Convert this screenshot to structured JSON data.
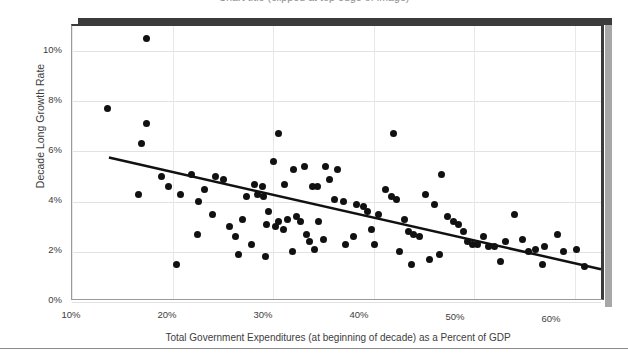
{
  "figure": {
    "title": "Chart title (clipped at top edge of image)",
    "background_color": "#ffffff",
    "frame_color": "#3b3b3b",
    "shadow_color": "#a7a7a7"
  },
  "chart_data": {
    "type": "scatter",
    "title": "",
    "xlabel": "Total Government Expenditures (at beginning of decade) as a Percent of GDP",
    "ylabel": "Decade Long Growth Rate",
    "xlim": [
      10,
      63
    ],
    "ylim": [
      0,
      11
    ],
    "grid": true,
    "legend": null,
    "marker_color": "#111111",
    "marker_size_px": 7,
    "xticks": [
      10,
      20,
      30,
      40,
      50,
      60
    ],
    "xticklabels": [
      "10%",
      "20%",
      "30%",
      "40%",
      "50%",
      "60%"
    ],
    "yticks": [
      0,
      2,
      4,
      6,
      8,
      10
    ],
    "yticklabels": [
      "0%",
      "2%",
      "4%",
      "6%",
      "8%",
      "10%"
    ],
    "series": [
      {
        "name": "Countries by decade",
        "points": [
          [
            17.4,
            10.5
          ],
          [
            13.5,
            7.7
          ],
          [
            17.4,
            7.1
          ],
          [
            16.9,
            6.3
          ],
          [
            30.5,
            6.7
          ],
          [
            42.0,
            6.7
          ],
          [
            16.6,
            4.3
          ],
          [
            21.9,
            5.1
          ],
          [
            24.3,
            5.0
          ],
          [
            25.1,
            4.9
          ],
          [
            22.6,
            4.0
          ],
          [
            30.0,
            5.6
          ],
          [
            33.1,
            5.4
          ],
          [
            36.4,
            5.3
          ],
          [
            28.1,
            4.7
          ],
          [
            28.9,
            4.6
          ],
          [
            27.4,
            4.2
          ],
          [
            28.4,
            4.3
          ],
          [
            29.0,
            4.2
          ],
          [
            31.1,
            4.7
          ],
          [
            32.0,
            5.3
          ],
          [
            33.9,
            4.6
          ],
          [
            34.4,
            4.6
          ],
          [
            35.2,
            5.4
          ],
          [
            35.6,
            4.9
          ],
          [
            27.0,
            3.3
          ],
          [
            29.5,
            3.6
          ],
          [
            29.3,
            3.1
          ],
          [
            30.2,
            3.0
          ],
          [
            30.5,
            3.2
          ],
          [
            31.4,
            3.3
          ],
          [
            31.0,
            2.9
          ],
          [
            32.3,
            3.4
          ],
          [
            32.7,
            3.2
          ],
          [
            33.3,
            2.7
          ],
          [
            34.5,
            3.2
          ],
          [
            36.1,
            4.1
          ],
          [
            37.0,
            4.0
          ],
          [
            38.3,
            3.9
          ],
          [
            39.0,
            3.8
          ],
          [
            39.4,
            3.6
          ],
          [
            40.5,
            3.5
          ],
          [
            41.2,
            4.5
          ],
          [
            41.8,
            4.2
          ],
          [
            42.3,
            4.1
          ],
          [
            43.1,
            3.3
          ],
          [
            43.5,
            2.8
          ],
          [
            44.0,
            2.7
          ],
          [
            44.6,
            2.6
          ],
          [
            45.2,
            4.3
          ],
          [
            46.0,
            3.9
          ],
          [
            46.7,
            5.1
          ],
          [
            47.3,
            3.4
          ],
          [
            47.9,
            3.2
          ],
          [
            48.4,
            3.1
          ],
          [
            48.9,
            2.8
          ],
          [
            49.3,
            2.4
          ],
          [
            49.8,
            2.3
          ],
          [
            50.3,
            2.3
          ],
          [
            50.9,
            2.6
          ],
          [
            51.4,
            2.2
          ],
          [
            52.0,
            2.2
          ],
          [
            53.1,
            2.4
          ],
          [
            54.0,
            3.5
          ],
          [
            54.8,
            2.5
          ],
          [
            55.4,
            2.0
          ],
          [
            56.1,
            2.1
          ],
          [
            57.0,
            2.2
          ],
          [
            58.3,
            2.7
          ],
          [
            58.9,
            2.0
          ],
          [
            60.2,
            2.1
          ],
          [
            61.0,
            1.4
          ],
          [
            20.4,
            1.5
          ],
          [
            26.6,
            1.9
          ],
          [
            29.2,
            1.8
          ],
          [
            31.9,
            2.0
          ],
          [
            34.1,
            2.1
          ],
          [
            24.0,
            3.5
          ],
          [
            25.7,
            3.0
          ],
          [
            22.5,
            2.7
          ],
          [
            26.3,
            2.6
          ],
          [
            37.2,
            2.3
          ],
          [
            38.0,
            2.6
          ],
          [
            40.1,
            2.3
          ],
          [
            42.6,
            2.0
          ],
          [
            45.5,
            1.7
          ],
          [
            46.5,
            1.9
          ],
          [
            52.6,
            1.6
          ],
          [
            43.8,
            1.5
          ],
          [
            35.0,
            2.5
          ],
          [
            33.6,
            2.4
          ],
          [
            39.8,
            2.9
          ],
          [
            27.8,
            2.3
          ],
          [
            23.2,
            4.5
          ],
          [
            19.6,
            4.6
          ],
          [
            18.9,
            5.0
          ],
          [
            20.8,
            4.3
          ],
          [
            56.8,
            1.5
          ]
        ]
      }
    ],
    "trendline": {
      "type": "linear-fit",
      "color": "#111111",
      "width_px": 2.5,
      "x_start": 13.7,
      "y_start": 5.7,
      "x_end": 63.0,
      "y_end": 1.2
    }
  },
  "axes": {
    "y": {
      "title": "Decade Long Growth Rate",
      "ticks": [
        "10%",
        "8%",
        "6%",
        "4%",
        "2%",
        "0%"
      ]
    },
    "x": {
      "title": "Total Government Expenditures (at beginning of decade) as a Percent of GDP",
      "ticks": [
        "10%",
        "20%",
        "30%",
        "40%",
        "50%",
        "60%"
      ]
    }
  }
}
